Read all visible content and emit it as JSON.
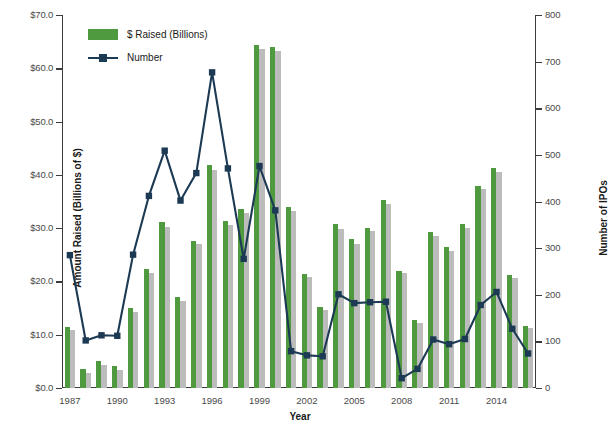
{
  "chart_data": {
    "type": "bar",
    "title": "",
    "xlabel": "Year",
    "ylabel": "Amount Raised (Billions of $)",
    "y2label": "Number of IPOs",
    "ylim": [
      0,
      70
    ],
    "y2lim": [
      0,
      800
    ],
    "ytick_labels": [
      "$0.0",
      "$10.0",
      "$20.0",
      "$30.0",
      "$40.0",
      "$50.0",
      "$60.0",
      "$70.0"
    ],
    "ytick_values": [
      0,
      10,
      20,
      30,
      40,
      50,
      60,
      70
    ],
    "y2tick_labels": [
      "0",
      "100",
      "200",
      "300",
      "400",
      "500",
      "600",
      "700",
      "800"
    ],
    "y2tick_values": [
      0,
      100,
      200,
      300,
      400,
      500,
      600,
      700,
      800
    ],
    "grid": false,
    "legend_position": "top-left",
    "categories": [
      "1987",
      "1988",
      "1989",
      "1990",
      "1991",
      "1992",
      "1993",
      "1994",
      "1995",
      "1996",
      "1997",
      "1998",
      "1999",
      "2000",
      "2001",
      "2002",
      "2003",
      "2004",
      "2005",
      "2006",
      "2007",
      "2008",
      "2009",
      "2010",
      "2011",
      "2012",
      "2013",
      "2014",
      "2015",
      "2016"
    ],
    "xtick_labels_shown": [
      "1987",
      "1990",
      "1993",
      "1996",
      "1999",
      "2002",
      "2005",
      "2008",
      "2011",
      "2014"
    ],
    "series": [
      {
        "name": "$ Raised (Billions)",
        "type": "bar",
        "color": "#4f9a3f",
        "axis": "left",
        "values": [
          11.4,
          3.5,
          5.0,
          4.1,
          15.1,
          22.4,
          31.2,
          17.0,
          27.6,
          41.8,
          31.4,
          33.6,
          64.4,
          64.0,
          33.9,
          21.4,
          15.2,
          30.8,
          28.0,
          30.1,
          35.2,
          22.0,
          12.7,
          29.3,
          26.5,
          30.7,
          38.0,
          41.2,
          21.2,
          11.7
        ]
      },
      {
        "name": "Secondary bar",
        "type": "bar",
        "color": "#bcbcbc",
        "axis": "left",
        "values": [
          10.8,
          2.9,
          4.3,
          3.3,
          14.3,
          21.5,
          30.2,
          16.3,
          27.0,
          41.0,
          30.6,
          32.8,
          63.6,
          63.3,
          33.3,
          20.9,
          14.6,
          29.9,
          27.1,
          29.4,
          34.6,
          21.5,
          12.2,
          28.6,
          25.8,
          30.0,
          37.3,
          40.5,
          20.6,
          11.2
        ]
      },
      {
        "name": "Number",
        "type": "line",
        "color": "#1c3a54",
        "axis": "right",
        "marker": "square",
        "values": [
          285,
          102,
          113,
          112,
          286,
          412,
          509,
          402,
          461,
          677,
          471,
          277,
          476,
          381,
          79,
          70,
          68,
          201,
          182,
          184,
          185,
          21,
          41,
          104,
          94,
          105,
          178,
          206,
          127,
          74
        ]
      }
    ]
  },
  "legend": {
    "items": [
      {
        "label": "$ Raised (Billions)",
        "color": "#4f9a3f",
        "kind": "swatch"
      },
      {
        "label": "Number",
        "color": "#1c3a54",
        "kind": "line-marker"
      }
    ]
  },
  "colors": {
    "bar_green": "#4f9a3f",
    "bar_gray": "#bcbcbc",
    "line_navy": "#1c3a54",
    "axis": "#3c3c3c",
    "tick_text": "#4a4a4a",
    "title_text": "#1a1a1a",
    "background": "#ffffff"
  }
}
